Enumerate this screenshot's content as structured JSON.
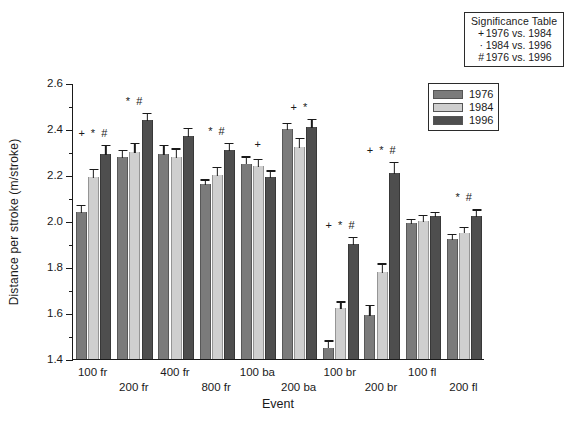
{
  "chart_data": {
    "type": "bar",
    "title": "",
    "xlabel": "Event",
    "ylabel": "Distance per stroke (m/stroke)",
    "ylim": [
      1.4,
      2.6
    ],
    "ytick_labels": [
      "2.6",
      "2.4",
      "2.2",
      "2.0",
      "1.8",
      "1.6",
      "1.4"
    ],
    "ytick_values": [
      2.6,
      2.4,
      2.2,
      2.0,
      1.8,
      1.6,
      1.4
    ],
    "yminor_step": 0.1,
    "grid": false,
    "legend_position": "upper-right",
    "categories": [
      "100 fr",
      "200 fr",
      "400 fr",
      "800 fr",
      "100 ba",
      "200 ba",
      "100 br",
      "200 br",
      "100 fl",
      "200 fl"
    ],
    "series": [
      {
        "name": "1976",
        "color": "#7b7b7b",
        "values": [
          2.04,
          2.28,
          2.29,
          2.16,
          2.25,
          2.4,
          1.45,
          1.59,
          1.99,
          1.92
        ],
        "errors": [
          0.035,
          0.035,
          0.045,
          0.025,
          0.035,
          0.03,
          0.035,
          0.05,
          0.025,
          0.03
        ]
      },
      {
        "name": "1984",
        "color": "#cfcfcf",
        "values": [
          2.19,
          2.3,
          2.28,
          2.2,
          2.24,
          2.32,
          1.62,
          1.78,
          2.0,
          1.95
        ],
        "errors": [
          0.04,
          0.045,
          0.04,
          0.04,
          0.035,
          0.045,
          0.035,
          0.04,
          0.03,
          0.03
        ]
      },
      {
        "name": "1996",
        "color": "#4e4e4e",
        "values": [
          2.29,
          2.44,
          2.37,
          2.31,
          2.19,
          2.41,
          1.9,
          2.21,
          2.02,
          2.02
        ]
      }
    ],
    "series_1996_errors": [
      0.045,
      0.035,
      0.04,
      0.035,
      0.035,
      0.04,
      0.035,
      0.05,
      0.025,
      0.035
    ],
    "annotations": [
      {
        "category": "100 fr",
        "marks": "+ * #"
      },
      {
        "category": "200 fr",
        "marks": "* #"
      },
      {
        "category": "400 fr",
        "marks": ""
      },
      {
        "category": "800 fr",
        "marks": "* #"
      },
      {
        "category": "100 ba",
        "marks": "+"
      },
      {
        "category": "200 ba",
        "marks": "+ *"
      },
      {
        "category": "100 br",
        "marks": "+ * #"
      },
      {
        "category": "200 br",
        "marks": "+ * #"
      },
      {
        "category": "100 fl",
        "marks": ""
      },
      {
        "category": "200 fl",
        "marks": "* #"
      }
    ]
  },
  "significance_table": {
    "title": "Significance Table",
    "rows": [
      {
        "symbol": "+",
        "text": "1976 vs. 1984"
      },
      {
        "symbol": "·",
        "text": "1984 vs. 1996"
      },
      {
        "symbol": "#",
        "text": "1976 vs. 1996"
      }
    ]
  },
  "legend": {
    "items": [
      {
        "label": "1976",
        "color": "#7b7b7b"
      },
      {
        "label": "1984",
        "color": "#cfcfcf"
      },
      {
        "label": "1996",
        "color": "#4e4e4e"
      }
    ]
  }
}
